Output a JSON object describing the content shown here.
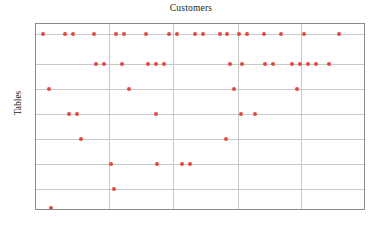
{
  "chart_data": {
    "type": "scatter",
    "title": "Customers",
    "xlabel": "",
    "ylabel": "Tables",
    "grid": true,
    "legend": null,
    "marker_color": "#e04a3f",
    "frame_color": "#8a8a8a",
    "grid_color": "#c9c9c9",
    "xlim": [
      0,
      330
    ],
    "ylim": [
      0,
      187
    ],
    "x_gridlines": [
      73,
      137,
      202,
      265
    ],
    "y_gridlines": [
      10,
      40,
      65,
      90,
      115,
      140,
      165
    ],
    "axis_ticklabels_visible": false,
    "points": [
      {
        "x": 7,
        "y": 10
      },
      {
        "x": 29,
        "y": 10
      },
      {
        "x": 37,
        "y": 10
      },
      {
        "x": 58,
        "y": 10
      },
      {
        "x": 80,
        "y": 10
      },
      {
        "x": 88,
        "y": 10
      },
      {
        "x": 110,
        "y": 10
      },
      {
        "x": 133,
        "y": 10
      },
      {
        "x": 141,
        "y": 10
      },
      {
        "x": 159,
        "y": 10
      },
      {
        "x": 167,
        "y": 10
      },
      {
        "x": 184,
        "y": 10
      },
      {
        "x": 191,
        "y": 10
      },
      {
        "x": 203,
        "y": 10
      },
      {
        "x": 211,
        "y": 10
      },
      {
        "x": 228,
        "y": 10
      },
      {
        "x": 245,
        "y": 10
      },
      {
        "x": 268,
        "y": 10
      },
      {
        "x": 303,
        "y": 10
      },
      {
        "x": 60,
        "y": 40
      },
      {
        "x": 68,
        "y": 40
      },
      {
        "x": 86,
        "y": 40
      },
      {
        "x": 112,
        "y": 40
      },
      {
        "x": 120,
        "y": 40
      },
      {
        "x": 128,
        "y": 40
      },
      {
        "x": 194,
        "y": 40
      },
      {
        "x": 206,
        "y": 40
      },
      {
        "x": 229,
        "y": 40
      },
      {
        "x": 237,
        "y": 40
      },
      {
        "x": 256,
        "y": 40
      },
      {
        "x": 264,
        "y": 40
      },
      {
        "x": 272,
        "y": 40
      },
      {
        "x": 280,
        "y": 40
      },
      {
        "x": 293,
        "y": 40
      },
      {
        "x": 13,
        "y": 65
      },
      {
        "x": 93,
        "y": 65
      },
      {
        "x": 198,
        "y": 65
      },
      {
        "x": 261,
        "y": 65
      },
      {
        "x": 33,
        "y": 90
      },
      {
        "x": 41,
        "y": 90
      },
      {
        "x": 120,
        "y": 90
      },
      {
        "x": 205,
        "y": 90
      },
      {
        "x": 219,
        "y": 90
      },
      {
        "x": 45,
        "y": 115
      },
      {
        "x": 190,
        "y": 115
      },
      {
        "x": 75,
        "y": 140
      },
      {
        "x": 121,
        "y": 140
      },
      {
        "x": 146,
        "y": 140
      },
      {
        "x": 154,
        "y": 140
      },
      {
        "x": 78,
        "y": 165
      },
      {
        "x": 15,
        "y": 184
      }
    ]
  }
}
